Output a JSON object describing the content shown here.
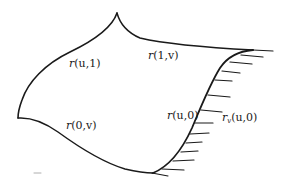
{
  "diagram": {
    "type": "parametric-surface-patch",
    "stroke_color": "#1a1a1a",
    "background": "#ffffff",
    "boundaries": [
      {
        "id": "top-left-edge",
        "label_fn": "r",
        "label_args": "(u,1)"
      },
      {
        "id": "top-right-edge",
        "label_fn": "r",
        "label_args": "(1,v)"
      },
      {
        "id": "bottom-left-edge",
        "label_fn": "r",
        "label_args": "(0,v)"
      },
      {
        "id": "right-edge",
        "label_fn": "r",
        "label_args": "(u,0)"
      }
    ],
    "tangent_label": {
      "fn": "r",
      "sub": "v",
      "args": "(u,0)"
    },
    "hatch_count": 11
  }
}
